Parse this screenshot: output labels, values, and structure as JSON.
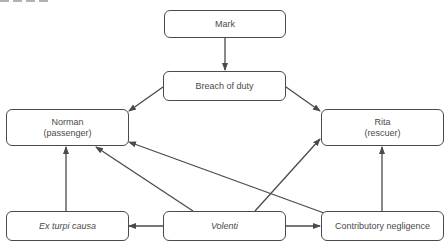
{
  "diagram": {
    "nodes": {
      "mark": {
        "label": "Mark"
      },
      "breach": {
        "label": "Breach of duty"
      },
      "norman": {
        "line1": "Norman",
        "line2": "(passenger)"
      },
      "rita": {
        "line1": "Rita",
        "line2": "(rescuer)"
      },
      "ex_turpi": {
        "label": "Ex turpi causa",
        "style": "italic"
      },
      "volenti": {
        "label": "Volenti",
        "style": "italic"
      },
      "contributory": {
        "label": "Contributory negligence"
      }
    },
    "edges": [
      {
        "from": "Mark",
        "to": "Breach of duty"
      },
      {
        "from": "Breach of duty",
        "to": "Norman (passenger)"
      },
      {
        "from": "Breach of duty",
        "to": "Rita (rescuer)"
      },
      {
        "from": "Ex turpi causa",
        "to": "Norman (passenger)"
      },
      {
        "from": "Volenti",
        "to": "Norman (passenger)"
      },
      {
        "from": "Volenti",
        "to": "Rita (rescuer)"
      },
      {
        "from": "Volenti",
        "to": "Ex turpi causa"
      },
      {
        "from": "Volenti",
        "to": "Contributory negligence"
      },
      {
        "from": "Contributory negligence",
        "to": "Norman (passenger)"
      },
      {
        "from": "Contributory negligence",
        "to": "Rita (rescuer)"
      }
    ],
    "colors": {
      "stroke": "#4a4a4a",
      "text": "#4a4a4a",
      "background": "#ffffff"
    }
  }
}
